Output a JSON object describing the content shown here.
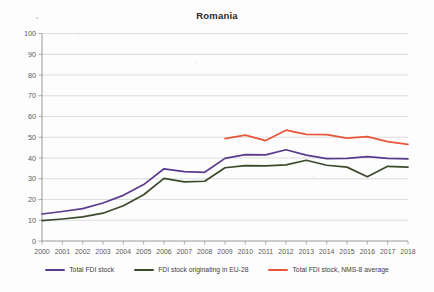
{
  "chart_data": {
    "type": "line",
    "title": "Romania",
    "xlabel": "",
    "ylabel": "",
    "ylim": [
      0,
      100
    ],
    "ytick_step": 10,
    "yticks": [
      0,
      10,
      20,
      30,
      40,
      50,
      60,
      70,
      80,
      90,
      100
    ],
    "grid": true,
    "legend_position": "bottom",
    "categories": [
      "2000",
      "2001",
      "2002",
      "2003",
      "2004",
      "2005",
      "2006",
      "2007",
      "2008",
      "2009",
      "2010",
      "2011",
      "2012",
      "2013",
      "2014",
      "2015",
      "2016",
      "2017",
      "2018"
    ],
    "series": [
      {
        "name": "Total FDI stock",
        "color": "#5b3a8e",
        "values": [
          13.0,
          14.2,
          15.6,
          18.3,
          22.0,
          27.2,
          34.8,
          33.4,
          33.1,
          39.8,
          41.6,
          41.5,
          44.0,
          41.4,
          39.7,
          39.8,
          40.7,
          39.8,
          39.6
        ]
      },
      {
        "name": "FDI stock originating in EU-28",
        "color": "#3c4a2c",
        "values": [
          9.8,
          10.6,
          11.6,
          13.4,
          17.0,
          22.3,
          30.2,
          28.5,
          28.8,
          35.3,
          36.3,
          36.2,
          36.7,
          38.9,
          36.5,
          35.6,
          31.0,
          36.0,
          35.6
        ]
      },
      {
        "name": "Total FDI stock, NMS-8 average",
        "color": "#e8553a",
        "values": [
          null,
          null,
          null,
          null,
          null,
          null,
          null,
          null,
          null,
          49.3,
          51.0,
          48.4,
          53.4,
          51.4,
          51.3,
          49.6,
          50.3,
          47.9,
          46.6
        ]
      }
    ]
  },
  "legend": {
    "items": [
      {
        "label": "Total FDI stock",
        "color": "#5b3a8e"
      },
      {
        "label": "FDI stock originating in EU-28",
        "color": "#3c4a2c"
      },
      {
        "label": "Total FDI stock, NMS-8 average",
        "color": "#e8553a"
      }
    ]
  }
}
